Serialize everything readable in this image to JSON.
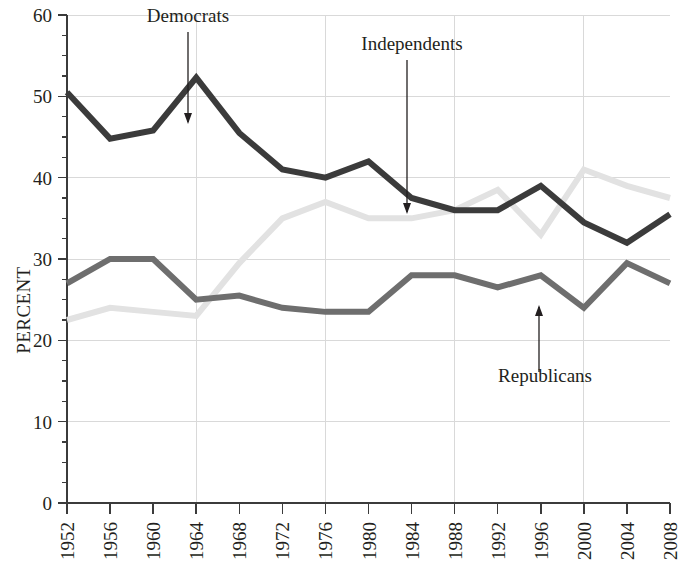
{
  "figure": {
    "background_color": "#ffffff",
    "y_axis_title": "PERCENT"
  },
  "annotations": {
    "democrats": {
      "label": "Democrats"
    },
    "independents": {
      "label": "Independents"
    },
    "republicans": {
      "label": "Republicans"
    }
  },
  "axis": {
    "y_tick_labels": [
      "0",
      "10",
      "20",
      "30",
      "40",
      "50",
      "60"
    ],
    "x_tick_labels": [
      "1952",
      "1956",
      "1960",
      "1964",
      "1968",
      "1972",
      "1976",
      "1980",
      "1984",
      "1988",
      "1992",
      "1996",
      "2000",
      "2004",
      "2008"
    ]
  },
  "chart_data": {
    "type": "line",
    "title": "",
    "subtitle": "",
    "xlabel": "",
    "ylabel": "PERCENT",
    "xlim": [
      1952,
      2008
    ],
    "ylim": [
      0,
      60
    ],
    "y_major_ticks": [
      0,
      10,
      20,
      30,
      40,
      50,
      60
    ],
    "y_minor_tick_step": 2.5,
    "grid": "both-major",
    "legend": "inline-annotations",
    "x": [
      1952,
      1956,
      1960,
      1964,
      1968,
      1972,
      1976,
      1980,
      1984,
      1988,
      1992,
      1996,
      2000,
      2004,
      2008
    ],
    "categories": [
      "1952",
      "1956",
      "1960",
      "1964",
      "1968",
      "1972",
      "1976",
      "1980",
      "1984",
      "1988",
      "1992",
      "1996",
      "2000",
      "2004",
      "2008"
    ],
    "series": [
      {
        "name": "Democrats",
        "color": "#3b3b3b",
        "stroke_width": 6,
        "values": [
          50.5,
          44.8,
          45.8,
          52.3,
          45.5,
          41.0,
          40.0,
          42.0,
          37.5,
          36.0,
          36.0,
          39.0,
          34.5,
          32.0,
          35.5
        ]
      },
      {
        "name": "Independents",
        "color": "#e2e2e2",
        "stroke_width": 6,
        "values": [
          22.5,
          24.0,
          23.5,
          23.0,
          29.5,
          35.0,
          37.0,
          35.0,
          35.0,
          36.0,
          38.5,
          33.0,
          41.0,
          39.0,
          37.5
        ]
      },
      {
        "name": "Republicans",
        "color": "#6e6e6e",
        "stroke_width": 6,
        "values": [
          27.0,
          30.0,
          30.0,
          25.0,
          25.5,
          24.0,
          23.5,
          23.5,
          28.0,
          28.0,
          26.5,
          28.0,
          24.0,
          29.5,
          27.0
        ]
      }
    ]
  }
}
